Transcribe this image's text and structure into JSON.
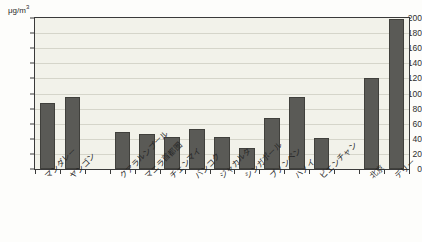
{
  "chart_data": {
    "type": "bar",
    "title": "",
    "subtitle": "",
    "xlabel": "",
    "ylabel": "",
    "unit_label": "μg/m",
    "unit_exponent": "3",
    "ylim": [
      0,
      200
    ],
    "ytick_values": [
      0,
      20,
      40,
      60,
      80,
      100,
      120,
      140,
      160,
      180,
      200
    ],
    "ytick_labels": [
      "0",
      "20",
      "40",
      "60",
      "80",
      "100",
      "120",
      "140",
      "160",
      "180",
      "200"
    ],
    "grid": true,
    "legend": "none",
    "bar_color": "#5a5a56",
    "plot_background": "#f2f2ea",
    "axis_color": "#3a3a3a",
    "categories": [
      "マンダレー",
      "ヤンゴン",
      "クアラルンプール",
      "マニラ首都圏",
      "チェンマイ",
      "バンコク",
      "ジャカルタ",
      "シンガポール",
      "プノンペン",
      "ハノイ",
      "ビエンチャン",
      "北京",
      "デリー"
    ],
    "values": [
      87,
      96,
      49,
      47,
      42,
      53,
      42,
      28,
      68,
      95,
      41,
      121,
      199
    ],
    "slot_index": [
      0,
      1,
      3,
      4,
      5,
      6,
      7,
      8,
      9,
      10,
      11,
      13,
      14
    ],
    "slot_count": 15
  }
}
